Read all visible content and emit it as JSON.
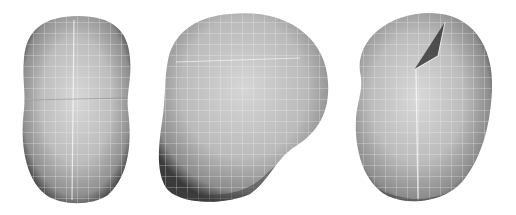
{
  "figure": {
    "background": "#ffffff",
    "shapes": [
      {
        "name": "mesh-blob-front",
        "view": "front"
      },
      {
        "name": "mesh-blob-side",
        "view": "side"
      },
      {
        "name": "mesh-blob-three-quarter",
        "view": "three-quarter"
      }
    ],
    "colors": {
      "highlight": "#dcdcdc",
      "mid": "#a8a8a8",
      "shadow": "#4a4a4a",
      "grid": "#f2f2f2"
    }
  }
}
